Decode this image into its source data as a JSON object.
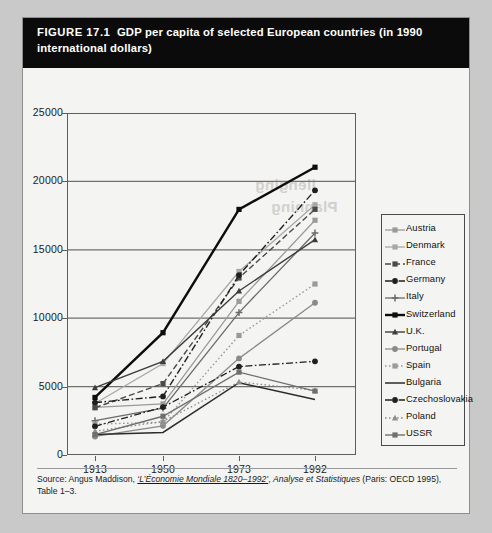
{
  "figure": {
    "number": "FIGURE 17.1",
    "caption": "GDP per capita of selected European countries (in 1990 international dollars)"
  },
  "source": {
    "prefix": "Source: Angus Maddison, ",
    "work": "‘L’Économie Mondiale 1820–1992’",
    "mid": ", ",
    "series": "Analyse et Statistiques",
    "suffix": " (Paris: OECD 1995), Table 1–3."
  },
  "chart_data": {
    "type": "line",
    "title": "GDP per capita of selected European countries (in 1990 international dollars)",
    "xlabel": "",
    "ylabel": "",
    "x": [
      "1913",
      "1950",
      "1973",
      "1992"
    ],
    "xtick_labels": [
      "1913",
      "1950",
      "1973",
      "1992"
    ],
    "ytick_labels": [
      "0",
      "5000",
      "10000",
      "15000",
      "20000",
      "25000"
    ],
    "ylim": [
      0,
      25000
    ],
    "yticks": [
      0,
      5000,
      10000,
      15000,
      20000,
      25000
    ],
    "grid": "horizontal",
    "legend_position": "right",
    "series": [
      {
        "name": "Austria",
        "values": [
          3488,
          3731,
          11235,
          17160
        ],
        "color": "#9a9a9a",
        "dash": "solid",
        "marker": "square",
        "width": 1.3
      },
      {
        "name": "Denmark",
        "values": [
          3764,
          6683,
          13416,
          18293
        ],
        "color": "#a8a8a8",
        "dash": "solid",
        "marker": "square",
        "width": 1.3
      },
      {
        "name": "France",
        "values": [
          3452,
          5221,
          12940,
          17959
        ],
        "color": "#4a4a4a",
        "dash": "dashed",
        "marker": "square",
        "width": 1.4
      },
      {
        "name": "Germany",
        "values": [
          3833,
          4281,
          13152,
          19351
        ],
        "color": "#1f1f1f",
        "dash": "dashdot",
        "marker": "circle",
        "width": 1.4
      },
      {
        "name": "Italy",
        "values": [
          2507,
          3425,
          10409,
          16229
        ],
        "color": "#6b6b6b",
        "dash": "solid",
        "marker": "plus",
        "width": 1.3
      },
      {
        "name": "Switzerland",
        "values": [
          4207,
          8939,
          17953,
          21036
        ],
        "color": "#0d0d0d",
        "dash": "solid",
        "marker": "square",
        "width": 2.4
      },
      {
        "name": "U.K.",
        "values": [
          4921,
          6847,
          11992,
          15738
        ],
        "color": "#3d3d3d",
        "dash": "solid",
        "marker": "triangle",
        "width": 1.4
      },
      {
        "name": "Portugal",
        "values": [
          1354,
          2132,
          7063,
          11130
        ],
        "color": "#8a8a8a",
        "dash": "solid",
        "marker": "circle",
        "width": 1.3
      },
      {
        "name": "Spain",
        "values": [
          2255,
          2397,
          8739,
          12498
        ],
        "color": "#9a9a9a",
        "dash": "dotted",
        "marker": "square",
        "width": 1.4
      },
      {
        "name": "Bulgaria",
        "values": [
          1498,
          1651,
          5284,
          4054
        ],
        "color": "#2b2b2b",
        "dash": "solid",
        "marker": "none",
        "width": 1.5
      },
      {
        "name": "Czechoslovakia",
        "values": [
          2096,
          3501,
          6466,
          6845
        ],
        "color": "#1f1f1f",
        "dash": "dashdot",
        "marker": "circle",
        "width": 1.3
      },
      {
        "name": "Poland",
        "values": [
          1739,
          2447,
          5340,
          4726
        ],
        "color": "#8f8f8f",
        "dash": "dotted",
        "marker": "triangle",
        "width": 1.3
      },
      {
        "name": "USSR",
        "values": [
          1488,
          2834,
          6058,
          4671
        ],
        "color": "#6f6f6f",
        "dash": "solid",
        "marker": "square",
        "width": 1.4
      }
    ]
  },
  "legend": {
    "items": [
      "Austria",
      "Denmark",
      "France",
      "Germany",
      "Italy",
      "Switzerland",
      "U.K.",
      "Portugal",
      "Spain",
      "Bulgaria",
      "Czechoslovakia",
      "Poland",
      "USSR"
    ]
  },
  "ghost_text": {
    "line1": "llenging",
    "line2": "Planning"
  }
}
